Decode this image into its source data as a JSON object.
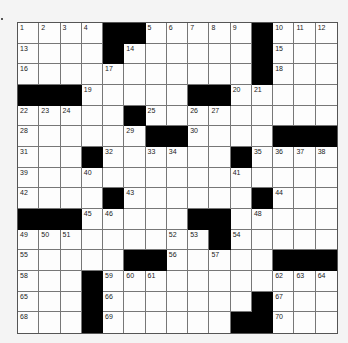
{
  "puzzle": {
    "rows": 15,
    "cols": 15,
    "colors": {
      "block": "#000000",
      "cell": "#fdfdfd",
      "line": "#777777"
    },
    "layout": [
      "....##.....#...",
      "....#......#...",
      "...........#...",
      "###.....##.....",
      ".....#.........",
      "......##....###",
      "...#......#....",
      "...............",
      "....#......#...",
      "###.....##.....",
      ".........#.....",
      ".....##.....###",
      "...#...........",
      "...#.......#...",
      "...#......##..."
    ],
    "numbers": [
      {
        "r": 0,
        "c": 0,
        "n": "1"
      },
      {
        "r": 0,
        "c": 1,
        "n": "2"
      },
      {
        "r": 0,
        "c": 2,
        "n": "3"
      },
      {
        "r": 0,
        "c": 3,
        "n": "4"
      },
      {
        "r": 0,
        "c": 6,
        "n": "5"
      },
      {
        "r": 0,
        "c": 7,
        "n": "6"
      },
      {
        "r": 0,
        "c": 8,
        "n": "7"
      },
      {
        "r": 0,
        "c": 9,
        "n": "8"
      },
      {
        "r": 0,
        "c": 10,
        "n": "9"
      },
      {
        "r": 0,
        "c": 12,
        "n": "10"
      },
      {
        "r": 0,
        "c": 13,
        "n": "11"
      },
      {
        "r": 0,
        "c": 14,
        "n": "12"
      },
      {
        "r": 1,
        "c": 0,
        "n": "13"
      },
      {
        "r": 1,
        "c": 5,
        "n": "14"
      },
      {
        "r": 1,
        "c": 12,
        "n": "15"
      },
      {
        "r": 2,
        "c": 0,
        "n": "16"
      },
      {
        "r": 2,
        "c": 4,
        "n": "17"
      },
      {
        "r": 2,
        "c": 12,
        "n": "18"
      },
      {
        "r": 3,
        "c": 3,
        "n": "19"
      },
      {
        "r": 3,
        "c": 10,
        "n": "20"
      },
      {
        "r": 3,
        "c": 11,
        "n": "21"
      },
      {
        "r": 4,
        "c": 0,
        "n": "22"
      },
      {
        "r": 4,
        "c": 1,
        "n": "23"
      },
      {
        "r": 4,
        "c": 2,
        "n": "24"
      },
      {
        "r": 4,
        "c": 6,
        "n": "25"
      },
      {
        "r": 4,
        "c": 8,
        "n": "26"
      },
      {
        "r": 4,
        "c": 9,
        "n": "27"
      },
      {
        "r": 5,
        "c": 0,
        "n": "28"
      },
      {
        "r": 5,
        "c": 5,
        "n": "29"
      },
      {
        "r": 5,
        "c": 8,
        "n": "30"
      },
      {
        "r": 6,
        "c": 0,
        "n": "31"
      },
      {
        "r": 6,
        "c": 4,
        "n": "32"
      },
      {
        "r": 6,
        "c": 6,
        "n": "33"
      },
      {
        "r": 6,
        "c": 7,
        "n": "34"
      },
      {
        "r": 6,
        "c": 11,
        "n": "35"
      },
      {
        "r": 6,
        "c": 12,
        "n": "36"
      },
      {
        "r": 6,
        "c": 13,
        "n": "37"
      },
      {
        "r": 6,
        "c": 14,
        "n": "38"
      },
      {
        "r": 7,
        "c": 0,
        "n": "39"
      },
      {
        "r": 7,
        "c": 3,
        "n": "40"
      },
      {
        "r": 7,
        "c": 10,
        "n": "41"
      },
      {
        "r": 8,
        "c": 0,
        "n": "42"
      },
      {
        "r": 8,
        "c": 5,
        "n": "43"
      },
      {
        "r": 8,
        "c": 12,
        "n": "44"
      },
      {
        "r": 9,
        "c": 3,
        "n": "45"
      },
      {
        "r": 9,
        "c": 4,
        "n": "46"
      },
      {
        "r": 9,
        "c": 9,
        "n": "47"
      },
      {
        "r": 9,
        "c": 11,
        "n": "48"
      },
      {
        "r": 10,
        "c": 0,
        "n": "49"
      },
      {
        "r": 10,
        "c": 1,
        "n": "50"
      },
      {
        "r": 10,
        "c": 2,
        "n": "51"
      },
      {
        "r": 10,
        "c": 7,
        "n": "52"
      },
      {
        "r": 10,
        "c": 8,
        "n": "53"
      },
      {
        "r": 10,
        "c": 10,
        "n": "54"
      },
      {
        "r": 11,
        "c": 0,
        "n": "55"
      },
      {
        "r": 11,
        "c": 7,
        "n": "56"
      },
      {
        "r": 11,
        "c": 9,
        "n": "57"
      },
      {
        "r": 12,
        "c": 0,
        "n": "58"
      },
      {
        "r": 12,
        "c": 4,
        "n": "59"
      },
      {
        "r": 12,
        "c": 5,
        "n": "60"
      },
      {
        "r": 12,
        "c": 6,
        "n": "61"
      },
      {
        "r": 12,
        "c": 12,
        "n": "62"
      },
      {
        "r": 12,
        "c": 13,
        "n": "63"
      },
      {
        "r": 12,
        "c": 14,
        "n": "64"
      },
      {
        "r": 13,
        "c": 0,
        "n": "65"
      },
      {
        "r": 13,
        "c": 4,
        "n": "66"
      },
      {
        "r": 13,
        "c": 12,
        "n": "67"
      },
      {
        "r": 14,
        "c": 0,
        "n": "68"
      },
      {
        "r": 14,
        "c": 4,
        "n": "69"
      },
      {
        "r": 14,
        "c": 12,
        "n": "70"
      }
    ]
  }
}
